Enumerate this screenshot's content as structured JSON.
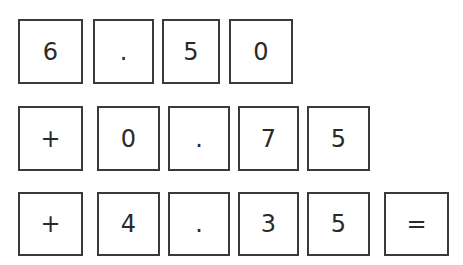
{
  "rows": [
    {
      "cells": [
        {
          "value": "6",
          "x": 18,
          "y": 19,
          "w": 65,
          "h": 65
        },
        {
          "value": ".",
          "x": 93,
          "y": 19,
          "w": 61,
          "h": 65
        },
        {
          "value": "5",
          "x": 162,
          "y": 19,
          "w": 58,
          "h": 65
        },
        {
          "value": "0",
          "x": 229,
          "y": 19,
          "w": 64,
          "h": 65
        }
      ]
    },
    {
      "cells": [
        {
          "value": "+",
          "x": 18,
          "y": 106,
          "w": 65,
          "h": 65
        },
        {
          "value": "0",
          "x": 97,
          "y": 106,
          "w": 63,
          "h": 65
        },
        {
          "value": ".",
          "x": 168,
          "y": 106,
          "w": 62,
          "h": 65
        },
        {
          "value": "7",
          "x": 238,
          "y": 106,
          "w": 61,
          "h": 65
        },
        {
          "value": "5",
          "x": 307,
          "y": 106,
          "w": 63,
          "h": 65
        }
      ]
    },
    {
      "cells": [
        {
          "value": "+",
          "x": 18,
          "y": 192,
          "w": 65,
          "h": 64
        },
        {
          "value": "4",
          "x": 97,
          "y": 192,
          "w": 63,
          "h": 64
        },
        {
          "value": ".",
          "x": 168,
          "y": 192,
          "w": 62,
          "h": 64
        },
        {
          "value": "3",
          "x": 238,
          "y": 192,
          "w": 61,
          "h": 64
        },
        {
          "value": "5",
          "x": 307,
          "y": 192,
          "w": 63,
          "h": 64
        },
        {
          "value": "=",
          "x": 384,
          "y": 192,
          "w": 65,
          "h": 64
        }
      ]
    }
  ]
}
